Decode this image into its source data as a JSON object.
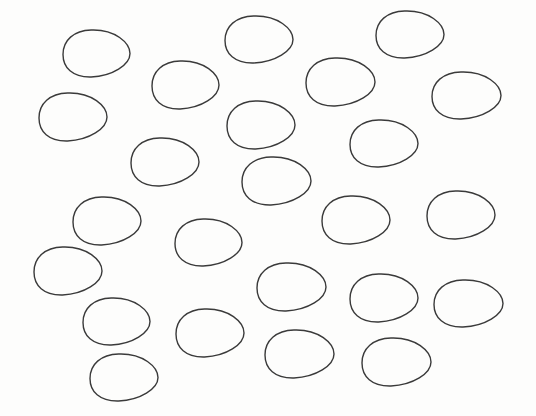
{
  "canvas": {
    "width": 536,
    "height": 416,
    "background": "#fdfdfc",
    "stroke_color": "#3a3a3a"
  },
  "shapes": {
    "type": "egg-outline",
    "count": 24,
    "items": [
      {
        "x": 63,
        "y": 30,
        "w": 67,
        "h": 47
      },
      {
        "x": 225,
        "y": 16,
        "w": 68,
        "h": 47
      },
      {
        "x": 376,
        "y": 11,
        "w": 68,
        "h": 47
      },
      {
        "x": 152,
        "y": 61,
        "w": 67,
        "h": 48
      },
      {
        "x": 306,
        "y": 58,
        "w": 69,
        "h": 48
      },
      {
        "x": 432,
        "y": 72,
        "w": 69,
        "h": 47
      },
      {
        "x": 39,
        "y": 93,
        "w": 68,
        "h": 48
      },
      {
        "x": 227,
        "y": 101,
        "w": 68,
        "h": 48
      },
      {
        "x": 350,
        "y": 120,
        "w": 68,
        "h": 47
      },
      {
        "x": 131,
        "y": 138,
        "w": 68,
        "h": 48
      },
      {
        "x": 242,
        "y": 157,
        "w": 69,
        "h": 48
      },
      {
        "x": 73,
        "y": 197,
        "w": 68,
        "h": 48
      },
      {
        "x": 322,
        "y": 196,
        "w": 68,
        "h": 48
      },
      {
        "x": 427,
        "y": 191,
        "w": 68,
        "h": 48
      },
      {
        "x": 175,
        "y": 219,
        "w": 67,
        "h": 47
      },
      {
        "x": 34,
        "y": 247,
        "w": 68,
        "h": 48
      },
      {
        "x": 257,
        "y": 263,
        "w": 69,
        "h": 48
      },
      {
        "x": 350,
        "y": 274,
        "w": 68,
        "h": 48
      },
      {
        "x": 434,
        "y": 280,
        "w": 69,
        "h": 47
      },
      {
        "x": 83,
        "y": 298,
        "w": 67,
        "h": 47
      },
      {
        "x": 176,
        "y": 309,
        "w": 68,
        "h": 48
      },
      {
        "x": 265,
        "y": 330,
        "w": 69,
        "h": 48
      },
      {
        "x": 362,
        "y": 338,
        "w": 69,
        "h": 48
      },
      {
        "x": 90,
        "y": 354,
        "w": 68,
        "h": 47
      }
    ]
  }
}
